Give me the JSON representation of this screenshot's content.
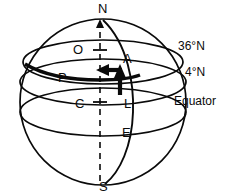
{
  "figure": {
    "stroke_color": "#0a0a0a",
    "fill_color": "#ffffff",
    "poles": {
      "north_label": "N",
      "south_label": "S"
    },
    "interior_points": [
      {
        "id": "O",
        "label": "O"
      },
      {
        "id": "A",
        "label": "A"
      },
      {
        "id": "P",
        "label": "P"
      },
      {
        "id": "C",
        "label": "C"
      },
      {
        "id": "L",
        "label": "L"
      },
      {
        "id": "E",
        "label": "E"
      }
    ],
    "latitude_labels": [
      {
        "id": "lat36",
        "label": "36°N"
      },
      {
        "id": "lat4",
        "label": "4°N"
      },
      {
        "id": "equator",
        "label": "Equator"
      }
    ],
    "vectors": [
      {
        "id": "horizontal-arrow",
        "direction": "left",
        "from_point": "P",
        "to_point": "O"
      },
      {
        "id": "vertical-arrow",
        "direction": "up",
        "from_point": "L",
        "to_point": "A"
      }
    ],
    "axis": {
      "id": "polar-axis",
      "style": "dashed",
      "from": "N",
      "to": "S"
    }
  }
}
